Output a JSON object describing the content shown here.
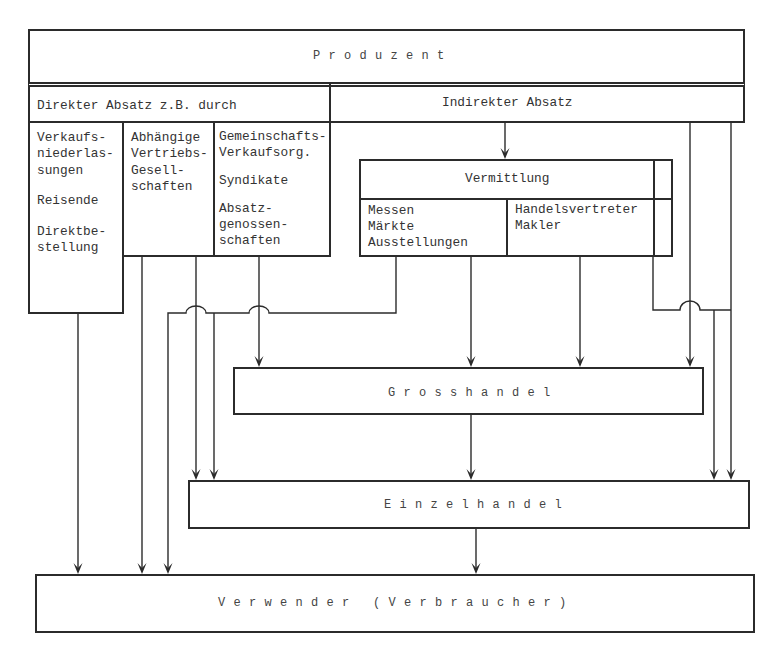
{
  "diagram": {
    "producer": {
      "label": "Produzent"
    },
    "direct_sales": {
      "header": "Direkter Absatz z.B. durch",
      "columns": [
        {
          "groups": [
            [
              "Verkaufs-",
              "niederlas-",
              "sungen"
            ],
            [
              "Reisende"
            ],
            [
              "Direktbe-",
              "stellung"
            ]
          ]
        },
        {
          "groups": [
            [
              "Abhängige",
              "Vertriebs-",
              "Gesell-",
              "schaften"
            ]
          ]
        },
        {
          "groups": [
            [
              "Gemeinschafts-",
              "Verkaufsorg."
            ],
            [
              "Syndikate"
            ],
            [
              "Absatz-",
              "genossen-",
              "schaften"
            ]
          ]
        }
      ]
    },
    "indirect_sales": {
      "header": "Indirekter Absatz"
    },
    "mediation": {
      "header": "Vermittlung",
      "events": [
        "Messen",
        "Märkte",
        "Ausstellungen"
      ],
      "agents": [
        "Handelsvertreter",
        "Makler"
      ]
    },
    "wholesale": {
      "label": "Grosshandel"
    },
    "retail": {
      "label": "Einzelhandel"
    },
    "consumer": {
      "label": "Verwender (Verbraucher)"
    }
  },
  "connections": [
    {
      "from": "indirect_sales",
      "to": "mediation"
    },
    {
      "from": "indirect_sales",
      "to": "wholesale"
    },
    {
      "from": "indirect_sales",
      "to": "retail"
    },
    {
      "from": "direct_sales.columns.0",
      "to": "consumer"
    },
    {
      "from": "direct_sales.columns.1",
      "to": "consumer"
    },
    {
      "from": "direct_sales.columns.1",
      "to": "retail"
    },
    {
      "from": "direct_sales.columns.2",
      "to": "wholesale"
    },
    {
      "from": "mediation.events",
      "to": "wholesale"
    },
    {
      "from": "mediation.events",
      "to": "retail"
    },
    {
      "from": "mediation.events",
      "to": "consumer"
    },
    {
      "from": "mediation.agents",
      "to": "wholesale"
    },
    {
      "from": "mediation",
      "to": "retail"
    },
    {
      "from": "wholesale",
      "to": "retail"
    },
    {
      "from": "retail",
      "to": "consumer"
    }
  ],
  "colors": {
    "line": "#2b2b2b",
    "text": "#333333",
    "background": "#ffffff"
  }
}
